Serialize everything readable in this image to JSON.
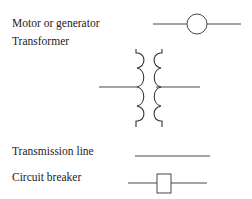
{
  "legend": {
    "title": "Power system symbols",
    "items": [
      {
        "label": "Motor or generator",
        "symbol": "circle-on-line-icon"
      },
      {
        "label": "Transformer",
        "symbol": "transformer-coils-icon"
      },
      {
        "label": "Transmission line",
        "symbol": "line-icon"
      },
      {
        "label": "Circuit breaker",
        "symbol": "box-on-line-icon"
      }
    ]
  },
  "colors": {
    "stroke": "#333333",
    "text": "#222222",
    "background": "#ffffff"
  }
}
